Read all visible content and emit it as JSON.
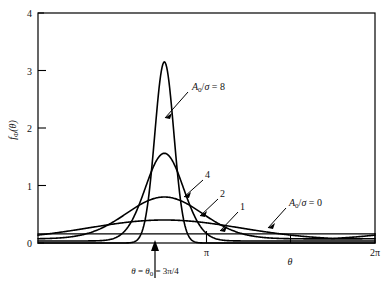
{
  "figure": {
    "kind": "line-plot",
    "background": "#ffffff",
    "ink_color": "#000000"
  },
  "axes": {
    "y_label": "f",
    "y_label_sub": "Φ",
    "y_label_arg": "(θ)",
    "x_label": "θ",
    "y_ticks": [
      "0",
      "1",
      "2",
      "3",
      "4"
    ],
    "y_tick_values": [
      0,
      1,
      2,
      3,
      4
    ],
    "x_ticks": [
      "π",
      "2π"
    ],
    "x_tick_values": [
      3.14159,
      6.28319
    ],
    "ylim": [
      0,
      4
    ],
    "xlim": [
      0,
      6.28319
    ],
    "grid": false
  },
  "annotations": {
    "theta0_label": "θ = θ₀ = 3π/4",
    "theta0_value": 2.35619,
    "top_curve_label": "A₀/σ = 8",
    "uniform_curve_label": "A₀/σ = 0",
    "curve_label_4": "4",
    "curve_label_2": "2",
    "curve_label_1": "1"
  },
  "chart_data": {
    "type": "line",
    "title": "",
    "xlabel": "θ",
    "ylabel": "f_Φ(θ)",
    "xlim": [
      0,
      6.28319
    ],
    "ylim": [
      0,
      4
    ],
    "xtick_labels": [
      "π",
      "2π"
    ],
    "xtick_values": [
      3.14159,
      6.28319
    ],
    "ytick_labels": [
      "0",
      "1",
      "2",
      "3",
      "4"
    ],
    "ytick_values": [
      0,
      1,
      2,
      3,
      4
    ],
    "grid": false,
    "legend": "inline-annotations",
    "center": 2.35619,
    "series": [
      {
        "name": "A₀/σ = 0",
        "label": "A₀/σ = 0",
        "ratio": 0,
        "peak": 0.159,
        "style": "flat-uniform",
        "x": [
          0.0,
          0.628,
          1.257,
          1.885,
          2.356,
          2.513,
          3.142,
          3.77,
          4.398,
          5.027,
          5.655,
          6.283
        ],
        "y": [
          0.159,
          0.159,
          0.159,
          0.159,
          0.159,
          0.159,
          0.159,
          0.159,
          0.159,
          0.159,
          0.159,
          0.159
        ]
      },
      {
        "name": "A₀/σ = 1",
        "label": "1",
        "ratio": 1,
        "peak": 0.4,
        "x": [
          0.0,
          0.393,
          0.785,
          1.178,
          1.571,
          1.963,
          2.356,
          2.749,
          3.142,
          3.534,
          3.927,
          4.32,
          4.712,
          5.105,
          5.498,
          5.89,
          6.283
        ],
        "y": [
          0.048,
          0.06,
          0.086,
          0.133,
          0.2,
          0.29,
          0.4,
          0.29,
          0.2,
          0.133,
          0.086,
          0.06,
          0.048,
          0.042,
          0.04,
          0.042,
          0.048
        ]
      },
      {
        "name": "A₀/σ = 2",
        "label": "2",
        "ratio": 2,
        "peak": 0.8,
        "x": [
          0.0,
          0.393,
          0.785,
          1.178,
          1.571,
          1.963,
          2.356,
          2.749,
          3.142,
          3.534,
          3.927,
          4.32,
          4.712,
          5.105,
          5.498,
          5.89,
          6.283
        ],
        "y": [
          0.006,
          0.012,
          0.03,
          0.085,
          0.22,
          0.5,
          0.8,
          0.5,
          0.22,
          0.085,
          0.03,
          0.012,
          0.006,
          0.004,
          0.003,
          0.004,
          0.006
        ]
      },
      {
        "name": "A₀/σ = 4",
        "label": "4",
        "ratio": 4,
        "peak": 1.56,
        "x": [
          0.0,
          0.393,
          0.785,
          1.178,
          1.571,
          1.767,
          1.963,
          2.16,
          2.356,
          2.553,
          2.749,
          2.945,
          3.142,
          3.534,
          3.927,
          4.32,
          4.712,
          5.105,
          5.498,
          5.89,
          6.283
        ],
        "y": [
          0.0,
          0.0,
          0.0,
          0.006,
          0.09,
          0.25,
          0.56,
          1.04,
          1.56,
          1.04,
          0.56,
          0.25,
          0.09,
          0.006,
          0.0,
          0.0,
          0.0,
          0.0,
          0.0,
          0.0,
          0.0
        ]
      },
      {
        "name": "A₀/σ = 8",
        "label": "A₀/σ = 8",
        "ratio": 8,
        "peak": 3.15,
        "x": [
          0.0,
          0.785,
          1.571,
          1.767,
          1.963,
          2.062,
          2.16,
          2.258,
          2.356,
          2.455,
          2.553,
          2.651,
          2.749,
          2.945,
          3.142,
          3.927,
          4.712,
          5.498,
          6.283
        ],
        "y": [
          0.0,
          0.0,
          0.0,
          0.004,
          0.06,
          0.2,
          0.56,
          1.4,
          3.15,
          1.4,
          0.56,
          0.2,
          0.06,
          0.004,
          0.0,
          0.0,
          0.0,
          0.0,
          0.0
        ]
      }
    ]
  }
}
